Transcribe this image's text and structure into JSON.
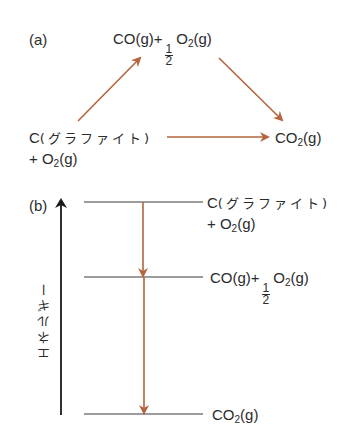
{
  "panel_a": {
    "label": "(a)",
    "top_species": {
      "prefix": "CO(g)",
      "plus": "+",
      "frac_num": "1",
      "frac_den": "2",
      "o": "O",
      "o_sub": "2",
      "o_suffix": "(g)"
    },
    "left_species": {
      "c": "C",
      "graphite": "(グラファイト)",
      "plus_line": "+ O",
      "o_sub": "2",
      "o_suffix": "(g)"
    },
    "right_species": {
      "co": "CO",
      "sub": "2",
      "suffix": "(g)"
    }
  },
  "panel_b": {
    "label": "(b)",
    "axis_label": "エネルギー",
    "levels": [
      {
        "c": "C",
        "graphite": "(グラファイト)",
        "plus_line": "+ O",
        "o_sub": "2",
        "o_suffix": "(g)"
      },
      {
        "prefix": "CO(g)",
        "plus": "+",
        "frac_num": "1",
        "frac_den": "2",
        "o": "O",
        "o_sub": "2",
        "o_suffix": "(g)"
      },
      {
        "co": "CO",
        "sub": "2",
        "suffix": "(g)"
      }
    ]
  },
  "colors": {
    "arrow": "#b5643d",
    "line": "#3a3a3a",
    "text": "#2b2b2b"
  }
}
